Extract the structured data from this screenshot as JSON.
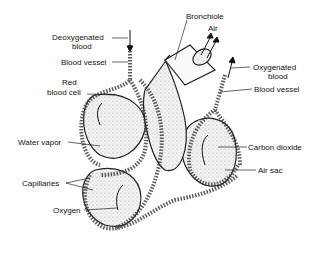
{
  "diagram": {
    "labels": {
      "bronchiole": "Bronchiole",
      "air": "Air",
      "deoxygenated_blood_1": "Deoxygenated",
      "deoxygenated_blood_2": "blood",
      "blood_vessel_left": "Blood vessel",
      "red_blood_cell_1": "Red",
      "red_blood_cell_2": "blood cell",
      "oxygenated_blood_1": "Oxygenated",
      "oxygenated_blood_2": "blood",
      "blood_vessel_right": "Blood vessel",
      "water_vapor": "Water vapor",
      "carbon_dioxide": "Carbon dioxide",
      "air_sac": "Air sac",
      "capillaries": "Capillaries",
      "oxygen": "Oxygen"
    },
    "colors": {
      "line": "#222222",
      "stipple": "#cfcfcf",
      "background": "#ffffff"
    }
  }
}
